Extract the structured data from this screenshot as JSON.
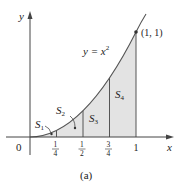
{
  "figure": {
    "caption": "(a)",
    "curve_label": "y = x",
    "curve_exponent": "2",
    "point_label": "(1, 1)",
    "axis_x_label": "x",
    "axis_y_label": "y",
    "origin_label": "0",
    "x_ticks": [
      {
        "num": "1",
        "den": "4"
      },
      {
        "num": "1",
        "den": "2"
      },
      {
        "num": "3",
        "den": "4"
      },
      {
        "label": "1"
      }
    ],
    "regions": [
      {
        "name": "S",
        "sub": "1"
      },
      {
        "name": "S",
        "sub": "2"
      },
      {
        "name": "S",
        "sub": "3"
      },
      {
        "name": "S",
        "sub": "4"
      }
    ],
    "colors": {
      "fill": "#e3e3e3",
      "stroke": "#555555",
      "axis": "#444444"
    }
  }
}
